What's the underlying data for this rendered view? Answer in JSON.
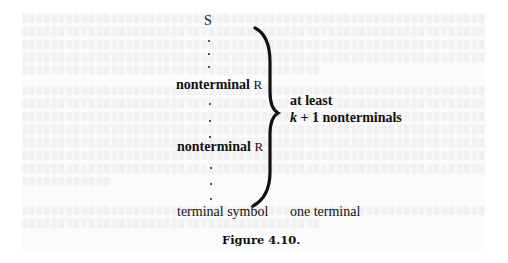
{
  "figure": {
    "caption": "Figure 4.10.",
    "start_symbol": "S",
    "nonterminal_rows": [
      {
        "word": "nonterminal",
        "symbol": "R"
      },
      {
        "word": "nonterminal",
        "symbol": "R"
      }
    ],
    "terminal_label": "terminal symbol",
    "brace_label": {
      "line1": "at least",
      "line2_var": "k",
      "line2_rest": " + 1 nonterminals"
    },
    "terminal_note": "one terminal",
    "dots_count": 9
  }
}
